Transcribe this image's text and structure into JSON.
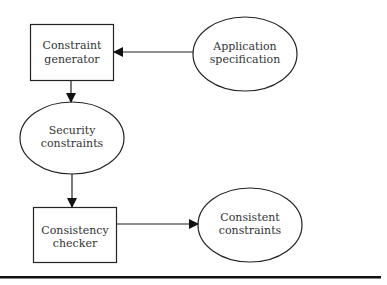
{
  "diagram": {
    "nodes": [
      {
        "id": "constraint-generator",
        "shape": "rect",
        "lines": [
          "Constraint",
          "generator"
        ]
      },
      {
        "id": "application-specification",
        "shape": "ellipse",
        "lines": [
          "Application",
          "specification"
        ]
      },
      {
        "id": "security-constraints",
        "shape": "ellipse",
        "lines": [
          "Security",
          "constraints"
        ]
      },
      {
        "id": "consistency-checker",
        "shape": "rect",
        "lines": [
          "Consistency",
          "checker"
        ]
      },
      {
        "id": "consistent-constraints",
        "shape": "ellipse",
        "lines": [
          "Consistent",
          "constraints"
        ]
      }
    ],
    "edges": [
      {
        "from": "application-specification",
        "to": "constraint-generator"
      },
      {
        "from": "constraint-generator",
        "to": "security-constraints"
      },
      {
        "from": "security-constraints",
        "to": "consistency-checker"
      },
      {
        "from": "consistency-checker",
        "to": "consistent-constraints"
      }
    ],
    "colors": {
      "stroke": "#222222",
      "text": "#333333",
      "background": "#ffffff"
    }
  }
}
